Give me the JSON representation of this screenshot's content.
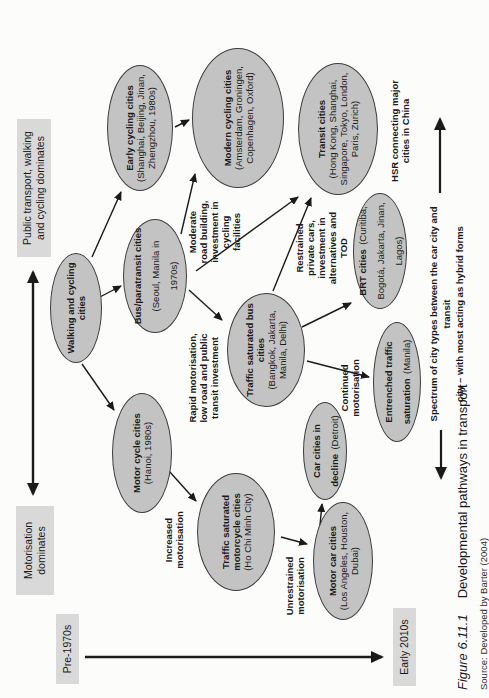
{
  "figure": {
    "caption_label": "Figure 6.11.1",
    "caption_text": "Developmental pathways in transport",
    "source_text": "Source: Developed by Barter (2004)"
  },
  "axes": {
    "time_start": "Pre-1970s",
    "time_end": "Early 2010s",
    "mode_left": "Motorisation\ndominates",
    "mode_right": "Public transport, walking\nand cycling dominates"
  },
  "nodes": [
    {
      "id": "walking-cycling",
      "title": "Walking and cycling cities",
      "subtitle": ""
    },
    {
      "id": "early-cycling",
      "title": "Early cycling cities",
      "subtitle": "(Shanghai, Beijing, Jinan, Zhengzhou, 1980s)"
    },
    {
      "id": "modern-cycling",
      "title": "Modern cycling cities",
      "subtitle": "(Amsterdam, Groningen, Copenhagen, Oxford)"
    },
    {
      "id": "bus-paratransit",
      "title": "Bus/paratransit cities",
      "subtitle": "(Seoul, Manila in 1970s)"
    },
    {
      "id": "transit",
      "title": "Transit cities",
      "subtitle": "(Hong Kong, Shanghai, Singapore, Tokyo, London, Paris, Zurich)"
    },
    {
      "id": "traffic-saturated-bus",
      "title": "Traffic saturated bus cities",
      "subtitle": "(Bangkok, Jakarta, Manila, Delhi)"
    },
    {
      "id": "brt",
      "title": "BRT cities",
      "subtitle": "(Curitiba, Bogotá, Jakarta, Jinan, Lagos)"
    },
    {
      "id": "entrenched-saturation",
      "title": "Entrenched traffic saturation",
      "subtitle": "(Manila)"
    },
    {
      "id": "car-decline",
      "title": "Car cities in decline",
      "subtitle": "(Detroit)"
    },
    {
      "id": "motor-cycle",
      "title": "Motor cycle cities",
      "subtitle": "(Hanoi, 1980s)"
    },
    {
      "id": "traffic-saturated-motorcycle",
      "title": "Traffic saturated motorcycle cities",
      "subtitle": "(Ho Chi Minh City)"
    },
    {
      "id": "motor-car",
      "title": "Motor car cities",
      "subtitle": "(Los Angeles, Houston, Dubai)"
    }
  ],
  "annotations": [
    {
      "id": "rapid",
      "text": "Rapid motorisation,\nlow road and public\ntransit investment"
    },
    {
      "id": "moderate",
      "text": "Moderate\nroad building,\ninvestment in\ncycling\nfacilities"
    },
    {
      "id": "restrained",
      "text": "Restrained\nprivate cars,\ninvestment in\nalternatives and\nTOD"
    },
    {
      "id": "increased",
      "text": "Increased\nmotorisation"
    },
    {
      "id": "unrestrained",
      "text": "Unrestrained\nmotorisation"
    },
    {
      "id": "continued",
      "text": "Continued\nmotorisation"
    },
    {
      "id": "hsr",
      "text": "HSR connecting major\ncities in China"
    }
  ],
  "spectrum": {
    "line1": "Spectrum of city types between the car city and transit",
    "line2": "city – with most acting as hybrid forms"
  },
  "colors": {
    "ellipse_fill": "#c3c3c3",
    "ellipse_stroke": "#3d3d3d",
    "label_box": "#d9d9d9",
    "arrow": "#1a1a1a",
    "background": "#fcfcfb"
  }
}
